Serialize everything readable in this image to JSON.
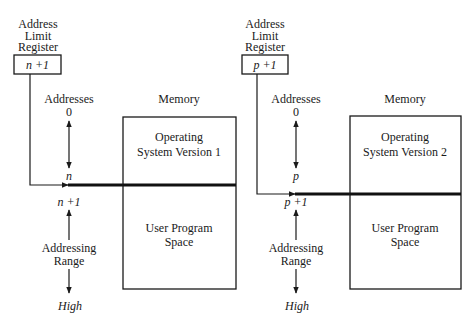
{
  "diagrams": [
    {
      "register": {
        "title_lines": [
          "Address",
          "Limit",
          "Register"
        ],
        "value": "n +1"
      },
      "addresses_label": "Addresses",
      "address_start": "0",
      "address_boundary": "n",
      "address_after": "n +1",
      "range_label_lines": [
        "Addressing",
        "Range"
      ],
      "address_end": "High",
      "memory": {
        "title": "Memory",
        "os_region_lines": [
          "Operating",
          "System Version 1"
        ],
        "user_region_lines": [
          "User Program",
          "Space"
        ]
      }
    },
    {
      "register": {
        "title_lines": [
          "Address",
          "Limit",
          "Register"
        ],
        "value": "p +1"
      },
      "addresses_label": "Addresses",
      "address_start": "0",
      "address_boundary": "p",
      "address_after": "p +1",
      "range_label_lines": [
        "Addressing",
        "Range"
      ],
      "address_end": "High",
      "memory": {
        "title": "Memory",
        "os_region_lines": [
          "Operating",
          "System Version 2"
        ],
        "user_region_lines": [
          "User Program",
          "Space"
        ]
      }
    }
  ],
  "colors": {
    "line": "#1a1a1a",
    "background": "#ffffff"
  }
}
